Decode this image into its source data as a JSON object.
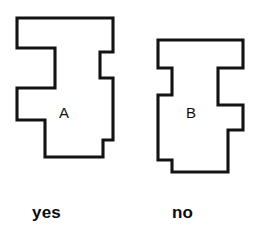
{
  "figure": {
    "background_color": "#ffffff",
    "stroke_color": "#131313",
    "fill_color": "#ffffff"
  },
  "shapes": [
    {
      "id": "shape-a",
      "label": "A",
      "caption": "yes",
      "points": "17,18 113,18 113,52 100,52 100,78 113,78 113,140 103,140 103,157 45,157 45,120 17,120 17,88 55,88 55,48 17,48"
    },
    {
      "id": "shape-b",
      "label": "B",
      "caption": "no",
      "points": "158,40 243,40 243,68 218,68 218,105 243,105 243,130 228,130 228,172 172,172 172,160 158,160 158,95 172,95 172,68 158,68"
    }
  ],
  "labels": {
    "shape_a_letter": "A",
    "shape_b_letter": "B"
  },
  "captions": {
    "left": "yes",
    "right": "no"
  }
}
